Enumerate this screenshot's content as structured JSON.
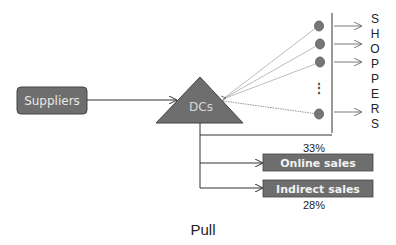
{
  "diagram": {
    "suppliers_label": "Suppliers",
    "dcs_label": "DCs",
    "shoppers_letters": [
      "S",
      "H",
      "O",
      "P",
      "P",
      "E",
      "R",
      "S"
    ],
    "ellipsis": "⋮",
    "online_sales_label": "Online sales",
    "online_sales_pct": "33%",
    "indirect_sales_label": "Indirect sales",
    "indirect_sales_pct": "28%",
    "caption": "Pull",
    "colors": {
      "box_fill": "#6e6e6e",
      "triangle_fill": "#6e6e6e",
      "node_fill": "#777777",
      "line": "#333333",
      "light_line": "#aaaaaa"
    }
  }
}
